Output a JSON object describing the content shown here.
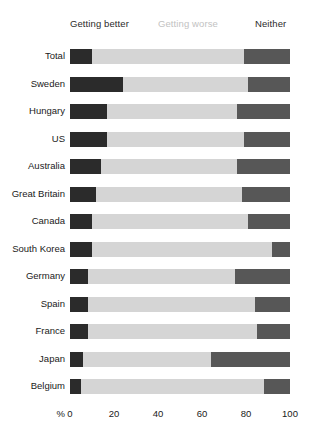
{
  "chart_data": {
    "type": "bar",
    "orientation": "horizontal",
    "stacked": true,
    "title": "",
    "subtitle": "",
    "xlabel": "%",
    "ylabel": "",
    "xlim": [
      0,
      100
    ],
    "xticks": [
      0,
      20,
      40,
      60,
      80,
      100
    ],
    "xtick_labels": [
      "0",
      "20",
      "40",
      "60",
      "80",
      "100"
    ],
    "grid": false,
    "legend_position": "top",
    "legend": [
      "Getting better",
      "Getting worse",
      "Neither"
    ],
    "series": [
      {
        "name": "Getting better",
        "color": "#2b2b2b",
        "values": [
          10,
          24,
          17,
          17,
          14,
          12,
          10,
          10,
          8,
          8,
          8,
          6,
          5
        ]
      },
      {
        "name": "Getting worse",
        "color": "#d5d5d5",
        "values": [
          69,
          57,
          59,
          62,
          62,
          66,
          71,
          82,
          67,
          76,
          77,
          58,
          83
        ]
      },
      {
        "name": "Neither",
        "color": "#575757",
        "values": [
          21,
          19,
          24,
          21,
          24,
          22,
          19,
          8,
          25,
          16,
          15,
          36,
          12
        ]
      }
    ],
    "categories": [
      "Total",
      "Sweden",
      "Hungary",
      "US",
      "Australia",
      "Great Britain",
      "Canada",
      "South Korea",
      "Germany",
      "Spain",
      "France",
      "Japan",
      "Belgium"
    ]
  },
  "legend": {
    "better": "Getting better",
    "worse": "Getting worse",
    "neither": "Neither"
  },
  "axis": {
    "unit": "%"
  },
  "colors": {
    "better": "#2b2b2b",
    "worse": "#d5d5d5",
    "neither": "#575757",
    "background": "#ffffff",
    "text": "#1a1a1a",
    "muted_text": "#c2c2c2"
  }
}
